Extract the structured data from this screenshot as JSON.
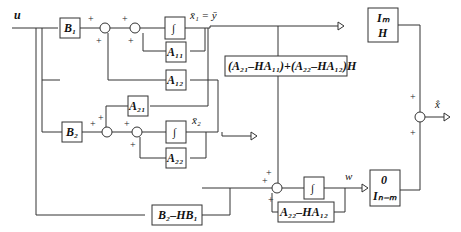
{
  "diagram": {
    "type": "block-diagram",
    "input": "u",
    "output": "x̂̇",
    "blocks": {
      "B1": "B₁",
      "B2": "B₂",
      "A11": "A₁₁",
      "A12": "A₁₂",
      "A21": "A₂₁",
      "A22": "A₂₂",
      "int1": "∫",
      "int2": "∫",
      "int3": "∫",
      "gain_big": "(A₂₁–HA₁₁)+(A₂₂–HA₁₂)H",
      "B2_HB1": "B₂–HB₁",
      "A22_HA12": "A₂₂–HA₁₂",
      "ImH_top": "Iₘ",
      "ImH_bottom": "H",
      "zero_top": "0",
      "zero_bottom": "Iₙ₋ₘ"
    },
    "signals": {
      "x1": "x̄₁ = ȳ",
      "x2": "x̄₂",
      "w": "w"
    },
    "signs": {
      "plus": "+"
    }
  }
}
